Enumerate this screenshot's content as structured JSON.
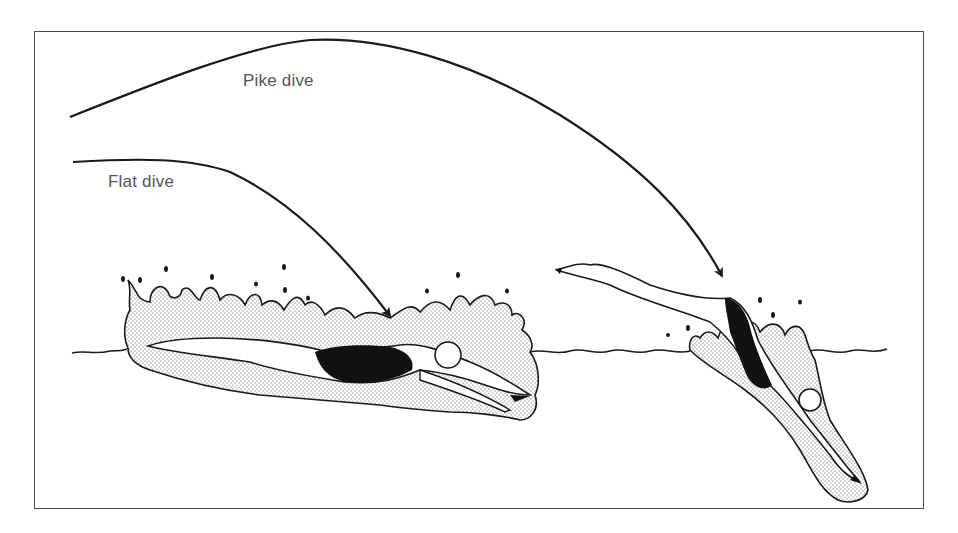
{
  "figure": {
    "type": "illustration",
    "labels": {
      "pike": "Pike dive",
      "flat": "Flat dive"
    },
    "elements": [
      {
        "id": "pike-trajectory",
        "kind": "arrow",
        "description": "high arching path ending at steep entry"
      },
      {
        "id": "flat-trajectory",
        "kind": "arrow",
        "description": "low flat path ending at shallow entry"
      },
      {
        "id": "flat-diver",
        "kind": "figure",
        "description": "swimmer entering water horizontally with splash"
      },
      {
        "id": "pike-diver",
        "kind": "figure",
        "description": "swimmer entering water steeply, legs raised"
      },
      {
        "id": "water-surface",
        "kind": "line",
        "description": "wavy water surface line"
      }
    ],
    "colors": {
      "line": "#1a1a1a",
      "swimsuit": "#111111",
      "splash_fill": "#e6e6e6",
      "label_text": "#555555",
      "frame": "#4a4a4a"
    }
  }
}
